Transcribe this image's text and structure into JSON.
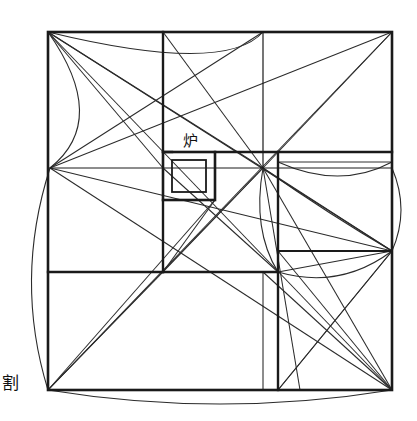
{
  "page": {
    "width": 417,
    "height": 421,
    "background_color": "#ffffff",
    "ink_color": "#1a1a1a",
    "thin_line_color": "#2b2b2b"
  },
  "labels": {
    "hearth": {
      "text": "炉",
      "meaning": "hearth / furnace",
      "x": 190,
      "y": 146,
      "font_size": 15
    },
    "margin_note": {
      "text": "割",
      "meaning": "division / proportioning",
      "x": 2,
      "y": 389,
      "font_size": 17
    }
  },
  "geometry": {
    "outer_square": {
      "name": "outer-boundary-square",
      "left": 48,
      "top": 32,
      "right": 392,
      "bottom": 390,
      "stroke_width": 2.6
    },
    "hubs": [
      {
        "name": "hub-left",
        "x": 50,
        "y": 168
      },
      {
        "name": "hub-center",
        "x": 263,
        "y": 168
      },
      {
        "name": "hub-right",
        "x": 392,
        "y": 251
      },
      {
        "name": "hub-top-left",
        "x": 48,
        "y": 32
      },
      {
        "name": "hub-top-right",
        "x": 392,
        "y": 32
      },
      {
        "name": "hub-bottom-left",
        "x": 48,
        "y": 390
      },
      {
        "name": "hub-bottom-right",
        "x": 392,
        "y": 390
      }
    ],
    "heavy_lines": [
      {
        "name": "grid-v-163-upper",
        "x1": 163,
        "y1": 32,
        "x2": 163,
        "y2": 152,
        "w": 2.4
      },
      {
        "name": "grid-v-163-lower",
        "x1": 163,
        "y1": 200,
        "x2": 163,
        "y2": 272,
        "w": 2.4
      },
      {
        "name": "grid-h-152-left",
        "x1": 163,
        "y1": 152,
        "x2": 172,
        "y2": 152,
        "w": 2.4
      },
      {
        "name": "grid-h-152-right",
        "x1": 215,
        "y1": 152,
        "x2": 392,
        "y2": 152,
        "w": 2.4
      },
      {
        "name": "grid-h-168-left",
        "x1": 48,
        "y1": 168,
        "x2": 163,
        "y2": 168,
        "w": 1.0
      },
      {
        "name": "grid-h-272-left",
        "x1": 48,
        "y1": 272,
        "x2": 163,
        "y2": 272,
        "w": 2.4
      },
      {
        "name": "grid-h-272-mid",
        "x1": 163,
        "y1": 272,
        "x2": 278,
        "y2": 272,
        "w": 2.4
      },
      {
        "name": "grid-v-278-upper",
        "x1": 278,
        "y1": 152,
        "x2": 278,
        "y2": 272,
        "w": 2.4
      },
      {
        "name": "grid-v-278-lower",
        "x1": 278,
        "y1": 272,
        "x2": 278,
        "y2": 390,
        "w": 2.4
      },
      {
        "name": "grid-h-251-right",
        "x1": 278,
        "y1": 251,
        "x2": 392,
        "y2": 251,
        "w": 2.0
      },
      {
        "name": "grid-v-263-upper",
        "x1": 263,
        "y1": 32,
        "x2": 263,
        "y2": 168,
        "w": 1.2
      },
      {
        "name": "grid-v-263-lower",
        "x1": 263,
        "y1": 272,
        "x2": 263,
        "y2": 390,
        "w": 1.0
      },
      {
        "name": "grid-h-168-center",
        "x1": 163,
        "y1": 168,
        "x2": 392,
        "y2": 168,
        "w": 1.0
      },
      {
        "name": "grid-h-160-right",
        "x1": 278,
        "y1": 162,
        "x2": 392,
        "y2": 162,
        "w": 0.9
      }
    ],
    "hearth_box": {
      "name": "hearth-outer-frame",
      "left": 163,
      "top": 152,
      "right": 215,
      "bottom": 200,
      "stroke_width": 2.6,
      "inner": {
        "name": "hearth-inner-square",
        "left": 172,
        "top": 160,
        "right": 206,
        "bottom": 192,
        "stroke_width": 1.8
      }
    },
    "diagonals": [
      {
        "name": "diag-tl-to-hubcenter",
        "x1": 48,
        "y1": 32,
        "x2": 263,
        "y2": 168
      },
      {
        "name": "diag-tl-to-br",
        "x1": 48,
        "y1": 32,
        "x2": 392,
        "y2": 390
      },
      {
        "name": "diag-tl-to-hubright",
        "x1": 48,
        "y1": 32,
        "x2": 392,
        "y2": 251
      },
      {
        "name": "diag-tr-to-hubleft",
        "x1": 392,
        "y1": 32,
        "x2": 50,
        "y2": 168
      },
      {
        "name": "diag-tr-to-bl",
        "x1": 392,
        "y1": 32,
        "x2": 48,
        "y2": 390
      },
      {
        "name": "diag-tr-to-hubcenter",
        "x1": 392,
        "y1": 32,
        "x2": 263,
        "y2": 168
      },
      {
        "name": "diag-v263top-to-hubleft",
        "x1": 263,
        "y1": 32,
        "x2": 50,
        "y2": 168
      },
      {
        "name": "diag-v163top-to-hubcenter",
        "x1": 163,
        "y1": 32,
        "x2": 263,
        "y2": 168
      },
      {
        "name": "diag-hubleft-to-br",
        "x1": 50,
        "y1": 168,
        "x2": 392,
        "y2": 390
      },
      {
        "name": "diag-hubleft-to-hubright",
        "x1": 50,
        "y1": 168,
        "x2": 392,
        "y2": 251
      },
      {
        "name": "diag-hubcenter-to-bl",
        "x1": 263,
        "y1": 168,
        "x2": 48,
        "y2": 390
      },
      {
        "name": "diag-hubcenter-to-br",
        "x1": 263,
        "y1": 168,
        "x2": 392,
        "y2": 390
      },
      {
        "name": "diag-hubcenter-to-hubright",
        "x1": 263,
        "y1": 168,
        "x2": 392,
        "y2": 251
      },
      {
        "name": "diag-hubcenter-down-278-390",
        "x1": 263,
        "y1": 168,
        "x2": 300,
        "y2": 390
      },
      {
        "name": "diag-hubright-to-bl-inner",
        "x1": 392,
        "y1": 251,
        "x2": 278,
        "y2": 390
      },
      {
        "name": "diag-hubright-to-278-272",
        "x1": 392,
        "y1": 251,
        "x2": 278,
        "y2": 272
      },
      {
        "name": "diag-278-251-to-br",
        "x1": 278,
        "y1": 251,
        "x2": 392,
        "y2": 390
      },
      {
        "name": "diag-278-390-to-hubright",
        "x1": 278,
        "y1": 390,
        "x2": 392,
        "y2": 251
      },
      {
        "name": "diag-hubcenter-to-163-272",
        "x1": 263,
        "y1": 168,
        "x2": 163,
        "y2": 272
      },
      {
        "name": "diag-163-168-to-278-272",
        "x1": 163,
        "y1": 168,
        "x2": 278,
        "y2": 272
      },
      {
        "name": "diag-163-272-to-263-168",
        "x1": 163,
        "y1": 272,
        "x2": 215,
        "y2": 200
      },
      {
        "name": "diag-tl-corner-fan-1",
        "x1": 48,
        "y1": 32,
        "x2": 163,
        "y2": 168
      },
      {
        "name": "diag-bl-to-hubcenter2",
        "x1": 48,
        "y1": 390,
        "x2": 215,
        "y2": 200
      },
      {
        "name": "diag-br-fan-to-263",
        "x1": 392,
        "y1": 390,
        "x2": 263,
        "y2": 272
      },
      {
        "name": "diag-bl-fan-up",
        "x1": 48,
        "y1": 390,
        "x2": 163,
        "y2": 272
      }
    ],
    "arcs": [
      {
        "name": "arc-top-left-corner",
        "d": "M 48 32 Q 110 120 50 168",
        "note": "arc swung from top-left corner"
      },
      {
        "name": "arc-top-span",
        "d": "M 48 32 Q 225 75 263 32",
        "note": "arc across top band"
      },
      {
        "name": "arc-left-long",
        "d": "M 50 168 Q 14 280 48 390",
        "note": "long left arc"
      },
      {
        "name": "arc-bottom-span",
        "d": "M 48 390 Q 220 418 392 390",
        "note": "arc across bottom"
      },
      {
        "name": "arc-center-down",
        "d": "M 263 168 Q 252 230 278 272",
        "note": "small arc below center hub"
      },
      {
        "name": "arc-right-upper",
        "d": "M 278 162 Q 340 190 392 162",
        "note": "arc in right upper panel"
      },
      {
        "name": "arc-right-lower",
        "d": "M 278 272 Q 340 290 392 251",
        "note": "arc in right panel toward right hub"
      },
      {
        "name": "arc-right-bulge",
        "d": "M 392 168 Q 410 210 392 251",
        "note": "small bulge at right edge"
      },
      {
        "name": "arc-center-to-right",
        "d": "M 263 168 Q 330 215 392 251",
        "note": "sweeping arc center hub to right hub"
      }
    ]
  },
  "legend": {
    "description": "Square floor plan with nested proportioning squares, converging diagonal construction lines, compass arcs, and a hearth box",
    "element_count_lines": 25,
    "element_count_arcs": 9
  }
}
